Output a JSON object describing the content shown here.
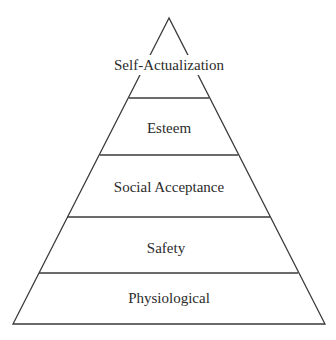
{
  "diagram": {
    "type": "pyramid",
    "line_color": "#3a3a3a",
    "text_color": "#2b2b2b",
    "levels": [
      {
        "label": "Self-Actualization"
      },
      {
        "label": "Esteem"
      },
      {
        "label": "Social Acceptance"
      },
      {
        "label": "Safety"
      },
      {
        "label": "Physiological"
      }
    ]
  }
}
